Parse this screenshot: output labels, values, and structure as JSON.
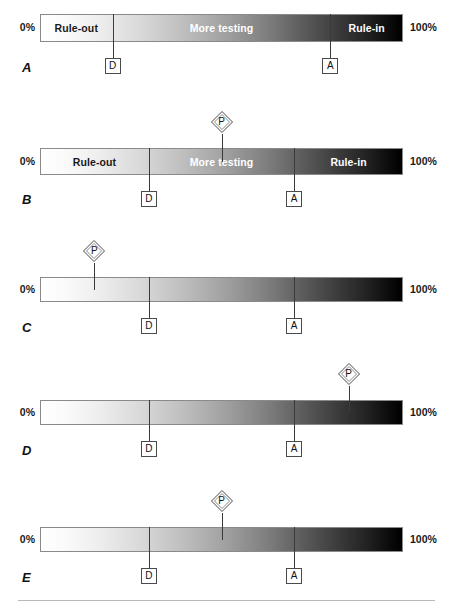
{
  "figure": {
    "axis_min_label": "0%",
    "axis_max_label": "100%",
    "bar_gradient": {
      "from": "#ffffff",
      "to": "#000000",
      "direction": "left-to-right"
    },
    "marker_names": {
      "test_threshold": "D",
      "treatment_threshold": "A",
      "prior_probability": "P"
    }
  },
  "chart_data": {
    "type": "bar",
    "title": "",
    "xlabel": "",
    "ylabel": "",
    "xlim": [
      0,
      100
    ],
    "grid": false,
    "legend": "none",
    "panels": [
      {
        "letter": "A",
        "axis_min_label": "0%",
        "axis_max_label": "100%",
        "zones": [
          {
            "label": "Rule-out",
            "start": 0,
            "end": 20,
            "text_color": "dark",
            "center": 10
          },
          {
            "label": "More testing",
            "start": 20,
            "end": 80,
            "text_color": "light",
            "center": 50
          },
          {
            "label": "Rule-in",
            "start": 80,
            "end": 100,
            "text_color": "light",
            "center": 90
          }
        ],
        "thresholds": [
          {
            "label": "D",
            "value": 20
          },
          {
            "label": "A",
            "value": 80
          }
        ],
        "prior": null
      },
      {
        "letter": "B",
        "axis_min_label": "0%",
        "axis_max_label": "100%",
        "zones": [
          {
            "label": "Rule-out",
            "start": 0,
            "end": 30,
            "text_color": "dark",
            "center": 15
          },
          {
            "label": "More testing",
            "start": 30,
            "end": 70,
            "text_color": "light",
            "center": 50
          },
          {
            "label": "Rule-in",
            "start": 70,
            "end": 100,
            "text_color": "light",
            "center": 85
          }
        ],
        "thresholds": [
          {
            "label": "D",
            "value": 30
          },
          {
            "label": "A",
            "value": 70
          }
        ],
        "prior": {
          "label": "P",
          "value": 50
        }
      },
      {
        "letter": "C",
        "axis_min_label": "0%",
        "axis_max_label": "100%",
        "zones": [],
        "thresholds": [
          {
            "label": "D",
            "value": 30
          },
          {
            "label": "A",
            "value": 70
          }
        ],
        "prior": {
          "label": "P",
          "value": 15
        }
      },
      {
        "letter": "D",
        "axis_min_label": "0%",
        "axis_max_label": "100%",
        "zones": [],
        "thresholds": [
          {
            "label": "D",
            "value": 30
          },
          {
            "label": "A",
            "value": 70
          }
        ],
        "prior": {
          "label": "P",
          "value": 85
        }
      },
      {
        "letter": "E",
        "axis_min_label": "0%",
        "axis_max_label": "100%",
        "zones": [],
        "thresholds": [
          {
            "label": "D",
            "value": 30
          },
          {
            "label": "A",
            "value": 70
          }
        ],
        "prior": {
          "label": "P",
          "value": 50
        }
      }
    ]
  }
}
